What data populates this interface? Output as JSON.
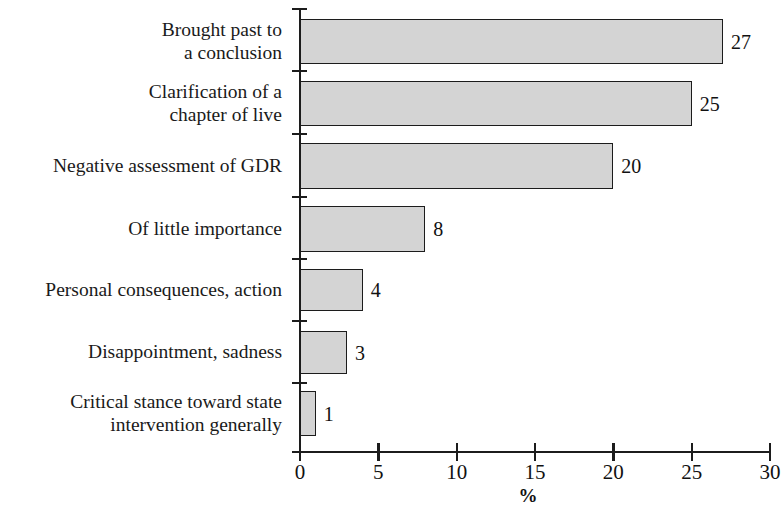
{
  "chart_data": {
    "type": "bar",
    "orientation": "horizontal",
    "title": "",
    "xlabel": "%",
    "ylabel": "",
    "xlim": [
      0,
      30
    ],
    "xticks": [
      0,
      5,
      10,
      15,
      20,
      25,
      30
    ],
    "xtick_labels": [
      "0",
      "5",
      "10",
      "15",
      "20",
      "25",
      "30"
    ],
    "grid": false,
    "legend": null,
    "bar_fill_color": "#d4d4d4",
    "bar_edge_color": "#1c1c1c",
    "categories": [
      "Brought past to\na conclusion",
      "Clarification of a\nchapter of live",
      "Negative assessment of GDR",
      "Of little importance",
      "Personal consequences, action",
      "Disappointment, sadness",
      "Critical stance toward state\nintervention generally"
    ],
    "values": [
      27,
      25,
      20,
      8,
      4,
      3,
      1
    ],
    "value_labels": [
      "27",
      "25",
      "20",
      "8",
      "4",
      "3",
      "1"
    ],
    "bars": [
      {
        "label_lines": [
          "Brought past to",
          "a conclusion"
        ],
        "value": 27,
        "value_label": "27",
        "top": 19,
        "height": 45
      },
      {
        "label_lines": [
          "Clarification of a",
          "chapter of live"
        ],
        "value": 25,
        "value_label": "25",
        "top": 81,
        "height": 45
      },
      {
        "label_lines": [
          "Negative assessment of GDR"
        ],
        "value": 20,
        "value_label": "20",
        "top": 143,
        "height": 46
      },
      {
        "label_lines": [
          "Of little importance"
        ],
        "value": 8,
        "value_label": "8",
        "top": 206,
        "height": 46
      },
      {
        "label_lines": [
          "Personal consequences, action"
        ],
        "value": 4,
        "value_label": "4",
        "top": 269,
        "height": 42
      },
      {
        "label_lines": [
          "Disappointment, sadness"
        ],
        "value": 3,
        "value_label": "3",
        "top": 331,
        "height": 43
      },
      {
        "label_lines": [
          "Critical stance toward state",
          "intervention generally"
        ],
        "value": 1,
        "value_label": "1",
        "top": 391,
        "height": 45
      }
    ]
  }
}
